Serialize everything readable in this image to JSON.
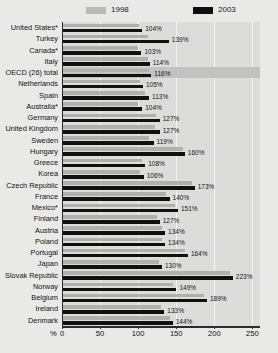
{
  "legend": {
    "series": [
      {
        "label": "1998",
        "color": "#b0b0ae",
        "name": "legend-1998"
      },
      {
        "label": "2003",
        "color": "#101010",
        "name": "legend-2003"
      }
    ]
  },
  "axis": {
    "unit_label": "%",
    "ticks": [
      "0",
      "50",
      "100",
      "150",
      "200",
      "250"
    ]
  },
  "chart_data": {
    "type": "bar",
    "orientation": "horizontal",
    "title": "",
    "subtitle": "",
    "xlabel": "%",
    "ylabel": "",
    "xlim": [
      0,
      260
    ],
    "grid": true,
    "legend_position": "top",
    "categories": [
      "United States*",
      "Turkey",
      "Canada*",
      "Italy",
      "OECD (26) total",
      "Netherlands",
      "Spain",
      "Australia*",
      "Germany",
      "United Kingdom",
      "Sweden",
      "Hungary",
      "Greece",
      "Korea",
      "Czech Republic",
      "France",
      "Mexico*",
      "Finland",
      "Austria",
      "Poland",
      "Portugal",
      "Japan",
      "Slovak Republic",
      "Norway",
      "Belgium",
      "Ireland",
      "Denmark"
    ],
    "highlight_category": "OECD (26) total",
    "series": [
      {
        "name": "1998",
        "color": "#b0b0ae",
        "values": [
          100,
          112,
          99,
          111,
          113,
          101,
          108,
          99,
          122,
          121,
          113,
          157,
          104,
          101,
          169,
          135,
          147,
          123,
          130,
          130,
          160,
          126,
          219,
          145,
          185,
          129,
          140
        ]
      },
      {
        "name": "2003",
        "color": "#101010",
        "values": [
          104,
          139,
          103,
          114,
          116,
          105,
          113,
          104,
          127,
          127,
          119,
          160,
          108,
          106,
          173,
          140,
          151,
          127,
          134,
          134,
          164,
          130,
          223,
          149,
          189,
          133,
          144
        ]
      }
    ],
    "data_labels": [
      "104%",
      "139%",
      "103%",
      "114%",
      "116%",
      "105%",
      "113%",
      "104%",
      "127%",
      "127%",
      "119%",
      "160%",
      "108%",
      "106%",
      "173%",
      "140%",
      "151%",
      "127%",
      "134%",
      "134%",
      "164%",
      "130%",
      "223%",
      "149%",
      "189%",
      "133%",
      "144%"
    ]
  }
}
